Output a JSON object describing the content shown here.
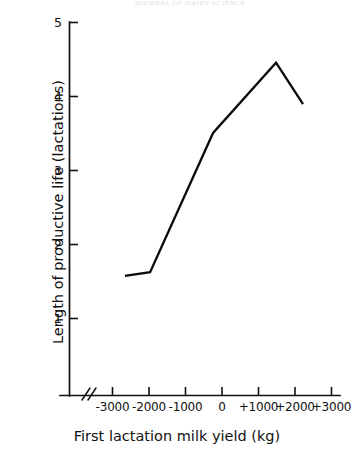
{
  "figure": {
    "top_header_remnant": "JOURNAL OF DAIRY SCIENCE",
    "background_color": "#ffffff",
    "line_color": "#0a0a0a",
    "axis_color": "#111111"
  },
  "chart_data": {
    "type": "line",
    "title": "",
    "subtitle": "",
    "xlabel": "First lactation milk yield (kg)",
    "ylabel": "Length of productive life (lactations)",
    "xlim": [
      -3000,
      3000
    ],
    "ylim": [
      0.6,
      5.0
    ],
    "xtick_labels": [
      "-3000",
      "-2000",
      "-1000",
      "0",
      "+1000",
      "+2000",
      "+3000"
    ],
    "xticks": [
      -3000,
      -2000,
      -1000,
      0,
      1000,
      2000,
      3000
    ],
    "ytick_labels": [
      "1",
      "2",
      "3",
      "4",
      "5"
    ],
    "yticks": [
      1,
      2,
      3,
      4,
      5
    ],
    "grid": false,
    "legend": null,
    "axis_break": true,
    "series": [
      {
        "name": "Length of productive life",
        "x": [
          -2660,
          -1970,
          -245,
          1480,
          2220
        ],
        "values": [
          1.57,
          1.62,
          3.5,
          4.45,
          3.89
        ]
      }
    ],
    "annotations": []
  }
}
